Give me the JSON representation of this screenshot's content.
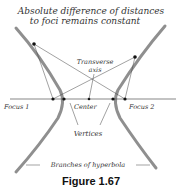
{
  "diagram": {
    "title_line1": "Absolute difference of distances",
    "title_line2": "to foci remains constant",
    "labels": {
      "transverse_line1": "Transverse",
      "transverse_line2": "axis",
      "focus1": "Focus 1",
      "focus2": "Focus 2",
      "center": "Center",
      "vertices": "Vertices",
      "branches": "Branches of hyperbola"
    },
    "colors": {
      "branch": "#9a9a9a",
      "line": "#444444",
      "point": "#111111"
    }
  },
  "caption": "Figure 1.67"
}
